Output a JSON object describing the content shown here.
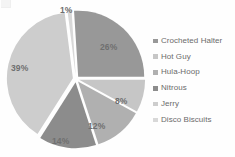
{
  "chart_data": {
    "type": "pie",
    "title": "",
    "subtitle": "",
    "xlabel": "",
    "ylabel": "",
    "grid": false,
    "exploded": true,
    "legend_position": "right",
    "data_labels": "percentage",
    "categories": [
      "Crocheted Halter",
      "Hot Guy",
      "Hula-Hoop",
      "Nitrous",
      "Jerry",
      "Disco Biscuits"
    ],
    "values": [
      26,
      8,
      12,
      14,
      39,
      1
    ],
    "value_labels": [
      "26%",
      "8%",
      "12%",
      "14%",
      "39%",
      "1%"
    ],
    "colors": [
      "#989898",
      "#c6c6c6",
      "#b0b0b0",
      "#8c8c8c",
      "#cdcdcd",
      "#d8d8d8"
    ],
    "series": [
      {
        "name": "Share",
        "values": [
          26,
          8,
          12,
          14,
          39,
          1
        ]
      }
    ]
  },
  "legend": {
    "items": [
      {
        "label": "Crocheted Halter",
        "color": "#989898"
      },
      {
        "label": "Hot Guy",
        "color": "#c6c6c6"
      },
      {
        "label": "Hula-Hoop",
        "color": "#b0b0b0"
      },
      {
        "label": "Nitrous",
        "color": "#8c8c8c"
      },
      {
        "label": "Jerry",
        "color": "#cdcdcd"
      },
      {
        "label": "Disco Biscuits",
        "color": "#d8d8d8"
      }
    ]
  },
  "labels": {
    "pct_crocheted_halter": "26%",
    "pct_hot_guy": "8%",
    "pct_hula_hoop": "12%",
    "pct_nitrous": "14%",
    "pct_jerry": "39%",
    "pct_disco_biscuits": "1%"
  }
}
